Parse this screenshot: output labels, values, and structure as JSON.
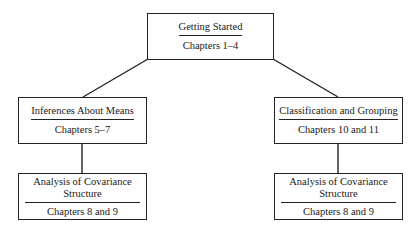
{
  "diagram": {
    "nodes": {
      "top": {
        "title": "Getting Started",
        "subtitle": "Chapters 1–4"
      },
      "mid_left": {
        "title": "Inferences About Means",
        "subtitle": "Chapters 5–7"
      },
      "mid_right": {
        "title": "Classification and Grouping",
        "subtitle": "Chapters 10 and 11"
      },
      "bottom_left": {
        "title_line1": "Analysis of Covariance",
        "title_line2": "Structure",
        "subtitle": "Chapters 8 and 9"
      },
      "bottom_right": {
        "title_line1": "Analysis of Covariance",
        "title_line2": "Structure",
        "subtitle": "Chapters 8 and 9"
      }
    },
    "edges": [
      {
        "from": "top",
        "to": "mid_left"
      },
      {
        "from": "top",
        "to": "mid_right"
      },
      {
        "from": "mid_left",
        "to": "bottom_left"
      },
      {
        "from": "mid_right",
        "to": "bottom_right"
      }
    ],
    "colors": {
      "line": "#222222",
      "background": "#ffffff"
    }
  }
}
